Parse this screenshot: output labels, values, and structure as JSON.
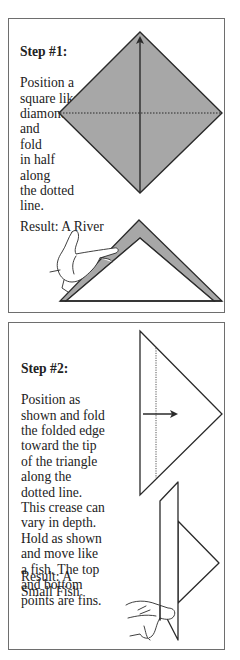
{
  "step1": {
    "heading": "Step #1:",
    "body": "Position a\nsquare like a\ndiamond\nand\nfold\nin half\nalong\nthe dotted\nline.",
    "result": "Result: A River",
    "illustrations": [
      "diamond-square-with-fold-arrow",
      "river-folded-triangle-with-hand"
    ]
  },
  "step2": {
    "heading": "Step #2:",
    "body": "Position as\nshown and fold\nthe folded edge\ntoward the tip\nof the triangle\nalong the\ndotted line.\nThis crease can\nvary in depth.\nHold as shown\nand move like\na fish. The top\nand bottom\npoints are fins.",
    "result": "Result: A\nSmall Fish",
    "illustrations": [
      "triangle-with-fold-arrow",
      "small-fish-held-by-hand"
    ]
  },
  "colors": {
    "paper_fill": "#a7a7a7",
    "line": "#2a2a2a",
    "panel_border": "#6e6e6e",
    "background": "#ffffff"
  }
}
